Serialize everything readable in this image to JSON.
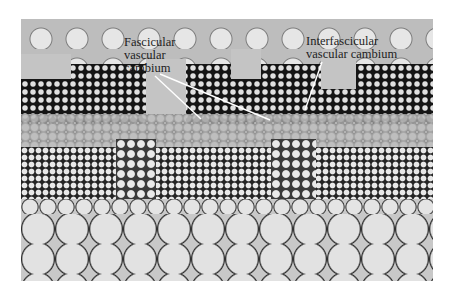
{
  "figure": {
    "labels": {
      "fascicular": [
        "Fascicular",
        "vascular",
        "cambium"
      ],
      "interfascicular": [
        "Interfascicular",
        "vascular cambium"
      ]
    },
    "colors": {
      "background": "#ffffff",
      "leader_line": "#ffffff",
      "label_text": "#1e1e1e"
    }
  }
}
